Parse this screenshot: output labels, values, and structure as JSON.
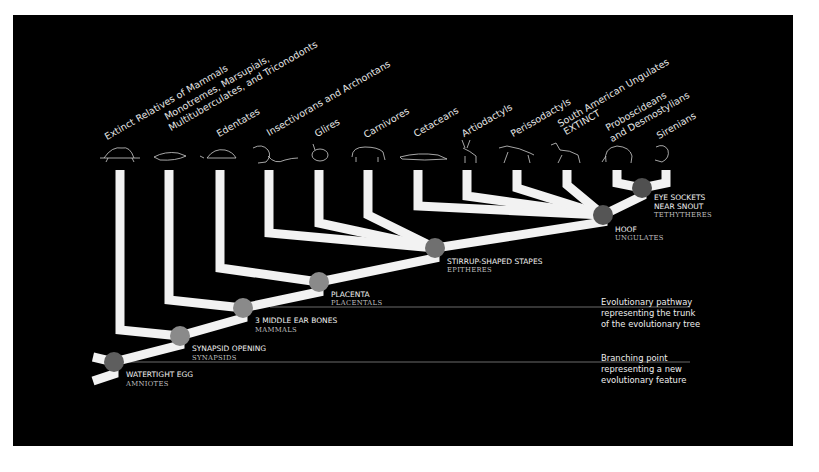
{
  "colors": {
    "background": "#000000",
    "frame": "#ffffff",
    "branch": "#f2f2f2",
    "node": "#7a7a7a",
    "node_dark": "#555555",
    "leader": "#6a6a6a"
  },
  "taxa": [
    {
      "label": "Extinct Relatives of Mammals",
      "stem_x": 120,
      "icon": "dimetrodon-icon"
    },
    {
      "label": "Monotremes, Marsupials,",
      "label2": "Multituberculates, and Triconodonts",
      "stem_x": 169,
      "icon": "platypus-icon"
    },
    {
      "label": "Edentates",
      "stem_x": 220,
      "icon": "armadillo-icon"
    },
    {
      "label": "Insectivorans and Archontans",
      "stem_x": 269,
      "icon": "monkey-icon"
    },
    {
      "label": "Glires",
      "stem_x": 319,
      "icon": "rabbit-icon"
    },
    {
      "label": "Carnivores",
      "stem_x": 368,
      "icon": "bear-icon"
    },
    {
      "label": "Cetaceans",
      "stem_x": 418,
      "icon": "whale-icon"
    },
    {
      "label": "Artiodactyls",
      "stem_x": 467,
      "icon": "deer-icon"
    },
    {
      "label": "Perissodactyls",
      "stem_x": 517,
      "icon": "horse-icon"
    },
    {
      "label": "South American Ungulates",
      "label2": "EXTINCT",
      "stem_x": 567,
      "icon": "macrauchenia-icon"
    },
    {
      "label": "Proboscideans",
      "label2": "and Desmostylians",
      "stem_x": 617,
      "icon": "elephant-icon"
    },
    {
      "label": "Sirenians",
      "stem_x": 666,
      "icon": "manatee-icon"
    }
  ],
  "nodes": [
    {
      "feature": "WATERTIGHT EGG",
      "clade": "AMNIOTES",
      "x": 114,
      "y": 362
    },
    {
      "feature": "SYNAPSID OPENING",
      "clade": "SYNAPSIDS",
      "x": 180,
      "y": 336
    },
    {
      "feature": "3 MIDDLE EAR BONES",
      "clade": "MAMMALS",
      "x": 243,
      "y": 308
    },
    {
      "feature": "PLACENTA",
      "clade": "PLACENTALS",
      "x": 319,
      "y": 282
    },
    {
      "feature": "STIRRUP-SHAPED STAPES",
      "clade": "EPITHERES",
      "x": 435,
      "y": 248
    },
    {
      "feature": "HOOF",
      "clade": "UNGULATES",
      "x": 603,
      "y": 215
    },
    {
      "feature": "EYE SOCKETS",
      "feature2": "NEAR SNOUT",
      "clade": "TETHYTHERES",
      "x": 642,
      "y": 188
    }
  ],
  "legend": {
    "pathway": [
      "Evolutionary pathway",
      "representing the trunk",
      "of the evolutionary tree"
    ],
    "branching": [
      "Branching point",
      "representing a new",
      "evolutionary feature"
    ]
  }
}
